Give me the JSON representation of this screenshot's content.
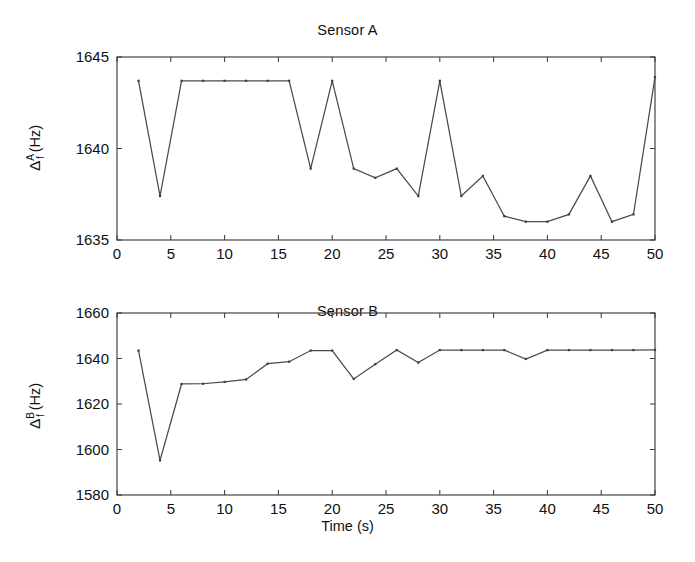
{
  "figure": {
    "background": "#ffffff",
    "line_color": "#4a4a4a",
    "axis_color": "#3c3c3c",
    "width": 695,
    "height": 562
  },
  "panels": [
    {
      "id": "sensor-a",
      "title": "Sensor A",
      "ylabel_delta": "Δ",
      "ylabel_sup": "A",
      "ylabel_sub": "f",
      "ylabel_unit": "(Hz)",
      "xlabel": "",
      "x_ticks": [
        0,
        5,
        10,
        15,
        20,
        25,
        30,
        35,
        40,
        45,
        50
      ],
      "y_ticks": [
        1635,
        1640,
        1645
      ]
    },
    {
      "id": "sensor-b",
      "title": "Sensor B",
      "ylabel_delta": "Δ",
      "ylabel_sup": "B",
      "ylabel_sub": "f",
      "ylabel_unit": "(Hz)",
      "xlabel": "Time (s)",
      "x_ticks": [
        0,
        5,
        10,
        15,
        20,
        25,
        30,
        35,
        40,
        45,
        50
      ],
      "y_ticks": [
        1580,
        1600,
        1620,
        1640,
        1660
      ]
    }
  ],
  "chart_data": [
    {
      "type": "line",
      "title": "Sensor A",
      "xlabel": "",
      "ylabel": "Δf^A (Hz)",
      "xlim": [
        0,
        50
      ],
      "ylim": [
        1635,
        1645
      ],
      "xticks": [
        0,
        5,
        10,
        15,
        20,
        25,
        30,
        35,
        40,
        45,
        50
      ],
      "yticks": [
        1635,
        1640,
        1645
      ],
      "grid": false,
      "legend": null,
      "markers": true,
      "x": [
        2,
        4,
        6,
        8,
        10,
        12,
        14,
        16,
        18,
        20,
        22,
        24,
        26,
        28,
        30,
        32,
        34,
        36,
        38,
        40,
        42,
        44,
        46,
        48,
        50
      ],
      "y": [
        1643.7,
        1637.4,
        1643.7,
        1643.7,
        1643.7,
        1643.7,
        1643.7,
        1643.7,
        1638.9,
        1643.7,
        1638.9,
        1638.4,
        1638.9,
        1637.4,
        1643.7,
        1637.4,
        1638.5,
        1636.3,
        1636.0,
        1636.0,
        1636.4,
        1638.5,
        1636.0,
        1636.4,
        1643.9
      ]
    },
    {
      "type": "line",
      "title": "Sensor B",
      "xlabel": "Time (s)",
      "ylabel": "Δf^B (Hz)",
      "xlim": [
        0,
        50
      ],
      "ylim": [
        1580,
        1660
      ],
      "xticks": [
        0,
        5,
        10,
        15,
        20,
        25,
        30,
        35,
        40,
        45,
        50
      ],
      "yticks": [
        1580,
        1600,
        1620,
        1640,
        1660
      ],
      "grid": false,
      "legend": null,
      "markers": true,
      "x": [
        2,
        4,
        6,
        8,
        10,
        12,
        14,
        16,
        18,
        20,
        22,
        24,
        26,
        28,
        30,
        32,
        34,
        36,
        38,
        40,
        42,
        44,
        46,
        48,
        50
      ],
      "y": [
        1643.5,
        1595.2,
        1628.8,
        1628.9,
        1629.7,
        1630.8,
        1637.7,
        1638.6,
        1643.5,
        1643.5,
        1631.0,
        1637.5,
        1643.7,
        1638.2,
        1643.7,
        1643.7,
        1643.7,
        1643.7,
        1639.8,
        1643.7,
        1643.7,
        1643.7,
        1643.7,
        1643.7,
        1643.8
      ]
    }
  ]
}
